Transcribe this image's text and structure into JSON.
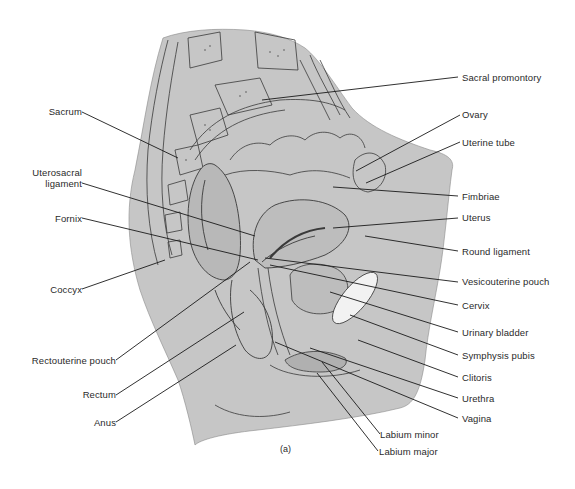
{
  "figure": {
    "panel_label": "(a)",
    "colors": {
      "tissue_fill": "#c6c6c6",
      "line": "#3a3a3a",
      "bladder_highlight": "#f2f2f2",
      "background": "#ffffff"
    }
  },
  "labels_left": [
    {
      "id": "sacrum",
      "text": "Sacrum"
    },
    {
      "id": "uterosacral-ligament-1",
      "text": "Uterosacral"
    },
    {
      "id": "uterosacral-ligament-2",
      "text": "ligament"
    },
    {
      "id": "fornix",
      "text": "Fornix"
    },
    {
      "id": "coccyx",
      "text": "Coccyx"
    },
    {
      "id": "rectouterine-pouch",
      "text": "Rectouterine pouch"
    },
    {
      "id": "rectum",
      "text": "Rectum"
    },
    {
      "id": "anus",
      "text": "Anus"
    }
  ],
  "labels_right": [
    {
      "id": "sacral-promontory",
      "text": "Sacral promontory"
    },
    {
      "id": "ovary",
      "text": "Ovary"
    },
    {
      "id": "uterine-tube",
      "text": "Uterine tube"
    },
    {
      "id": "fimbriae",
      "text": "Fimbriae"
    },
    {
      "id": "uterus",
      "text": "Uterus"
    },
    {
      "id": "round-ligament",
      "text": "Round ligament"
    },
    {
      "id": "vesicouterine-pouch",
      "text": "Vesicouterine pouch"
    },
    {
      "id": "cervix",
      "text": "Cervix"
    },
    {
      "id": "urinary-bladder",
      "text": "Urinary bladder"
    },
    {
      "id": "symphysis-pubis",
      "text": "Symphysis pubis"
    },
    {
      "id": "clitoris",
      "text": "Clitoris"
    },
    {
      "id": "urethra",
      "text": "Urethra"
    },
    {
      "id": "vagina",
      "text": "Vagina"
    }
  ],
  "labels_bottom": [
    {
      "id": "labium-minor",
      "text": "Labium minor"
    },
    {
      "id": "labium-major",
      "text": "Labium major"
    }
  ]
}
